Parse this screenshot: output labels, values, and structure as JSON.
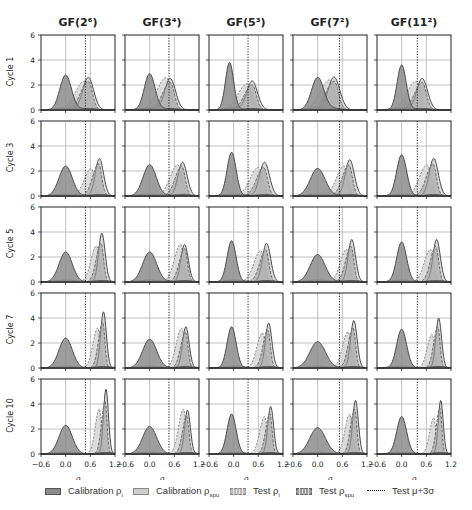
{
  "figure": {
    "columns": [
      "GF(2⁶)",
      "GF(3⁴)",
      "GF(5³)",
      "GF(7²)",
      "GF(11²)"
    ],
    "rows": [
      "Cycle 1",
      "Cycle 3",
      "Cycle 5",
      "Cycle 7",
      "Cycle 10"
    ],
    "xlabel": "ρ",
    "x_ticks": [
      "−0.6",
      "0.0",
      "0.6",
      "1.2"
    ],
    "y_ticks": [
      "0",
      "2",
      "4",
      "6"
    ]
  },
  "legend": {
    "items": [
      {
        "label": "Calibration ρ",
        "sub": "i"
      },
      {
        "label": "Calibration ρ",
        "sub": "spu"
      },
      {
        "label": "Test ρ",
        "sub": "i"
      },
      {
        "label": "Test ρ",
        "sub": "spu"
      },
      {
        "label": "Test μ+3σ",
        "sub": ""
      }
    ]
  },
  "colors": {
    "cal_pi": "#8c8c8c",
    "cal_psu": "#cfcfcf",
    "outline": "#4a4a4a",
    "grid": "#b0b0b0",
    "axis": "#222222"
  },
  "chart_data": {
    "type": "area",
    "title": "",
    "xlabel": "ρ",
    "ylabel": "density",
    "xlim": [
      -0.6,
      1.2
    ],
    "ylim": [
      0,
      6
    ],
    "grid": true,
    "legend_position": "bottom",
    "columns": [
      "GF(2⁶)",
      "GF(3⁴)",
      "GF(5³)",
      "GF(7²)",
      "GF(11²)"
    ],
    "rows": [
      "Cycle 1",
      "Cycle 3",
      "Cycle 5",
      "Cycle 7",
      "Cycle 10"
    ],
    "threshold_mu_plus_3sigma": [
      0.48,
      0.47,
      0.35,
      0.53,
      0.38
    ],
    "panels": [
      [
        {
          "cal_pi": {
            "mu": 0.0,
            "peak": 2.8,
            "sd": 0.14
          },
          "cal_psu": {
            "mu": 0.55,
            "peak": 2.6,
            "sd": 0.13
          },
          "test_pi": {
            "mu": 0.45,
            "peak": 2.3
          },
          "test_psu": {
            "mu": 0.55,
            "peak": 2.5
          }
        },
        {
          "cal_pi": {
            "mu": 0.0,
            "peak": 2.9,
            "sd": 0.13
          },
          "cal_psu": {
            "mu": 0.5,
            "peak": 2.5,
            "sd": 0.13
          },
          "test_pi": {
            "mu": 0.4,
            "peak": 2.6
          },
          "test_psu": {
            "mu": 0.5,
            "peak": 2.4
          }
        },
        {
          "cal_pi": {
            "mu": -0.1,
            "peak": 3.8,
            "sd": 0.1
          },
          "cal_psu": {
            "mu": 0.45,
            "peak": 2.3,
            "sd": 0.13
          },
          "test_pi": {
            "mu": 0.33,
            "peak": 2.1
          },
          "test_psu": {
            "mu": 0.45,
            "peak": 2.2
          }
        },
        {
          "cal_pi": {
            "mu": 0.0,
            "peak": 2.6,
            "sd": 0.15
          },
          "cal_psu": {
            "mu": 0.4,
            "peak": 2.6,
            "sd": 0.14
          },
          "test_pi": {
            "mu": 0.3,
            "peak": 2.4
          },
          "test_psu": {
            "mu": 0.4,
            "peak": 2.5
          }
        },
        {
          "cal_pi": {
            "mu": 0.0,
            "peak": 3.6,
            "sd": 0.11
          },
          "cal_psu": {
            "mu": 0.5,
            "peak": 2.5,
            "sd": 0.13
          },
          "test_pi": {
            "mu": 0.35,
            "peak": 2.3
          },
          "test_psu": {
            "mu": 0.5,
            "peak": 2.4
          }
        }
      ],
      [
        {
          "cal_pi": {
            "mu": 0.0,
            "peak": 2.4,
            "sd": 0.16
          },
          "cal_psu": {
            "mu": 0.82,
            "peak": 3.0,
            "sd": 0.1
          },
          "test_pi": {
            "mu": 0.62,
            "peak": 2.2
          },
          "test_psu": {
            "mu": 0.8,
            "peak": 2.8
          }
        },
        {
          "cal_pi": {
            "mu": 0.0,
            "peak": 2.5,
            "sd": 0.16
          },
          "cal_psu": {
            "mu": 0.8,
            "peak": 2.7,
            "sd": 0.11
          },
          "test_pi": {
            "mu": 0.68,
            "peak": 2.5
          },
          "test_psu": {
            "mu": 0.78,
            "peak": 2.6
          }
        },
        {
          "cal_pi": {
            "mu": -0.05,
            "peak": 3.5,
            "sd": 0.11
          },
          "cal_psu": {
            "mu": 0.75,
            "peak": 2.7,
            "sd": 0.12
          },
          "test_pi": {
            "mu": 0.6,
            "peak": 2.3
          },
          "test_psu": {
            "mu": 0.73,
            "peak": 2.5
          }
        },
        {
          "cal_pi": {
            "mu": 0.0,
            "peak": 2.2,
            "sd": 0.18
          },
          "cal_psu": {
            "mu": 0.78,
            "peak": 2.9,
            "sd": 0.11
          },
          "test_pi": {
            "mu": 0.64,
            "peak": 2.4
          },
          "test_psu": {
            "mu": 0.76,
            "peak": 2.7
          }
        },
        {
          "cal_pi": {
            "mu": 0.0,
            "peak": 3.3,
            "sd": 0.12
          },
          "cal_psu": {
            "mu": 0.78,
            "peak": 3.0,
            "sd": 0.11
          },
          "test_pi": {
            "mu": 0.62,
            "peak": 2.5
          },
          "test_psu": {
            "mu": 0.76,
            "peak": 2.8
          }
        }
      ],
      [
        {
          "cal_pi": {
            "mu": 0.0,
            "peak": 2.4,
            "sd": 0.16
          },
          "cal_psu": {
            "mu": 0.88,
            "peak": 3.9,
            "sd": 0.08
          },
          "test_pi": {
            "mu": 0.75,
            "peak": 2.9
          },
          "test_psu": {
            "mu": 0.86,
            "peak": 3.4
          }
        },
        {
          "cal_pi": {
            "mu": 0.0,
            "peak": 2.4,
            "sd": 0.17
          },
          "cal_psu": {
            "mu": 0.85,
            "peak": 3.0,
            "sd": 0.09
          },
          "test_pi": {
            "mu": 0.75,
            "peak": 3.0
          },
          "test_psu": {
            "mu": 0.85,
            "peak": 2.9
          }
        },
        {
          "cal_pi": {
            "mu": -0.05,
            "peak": 3.3,
            "sd": 0.11
          },
          "cal_psu": {
            "mu": 0.8,
            "peak": 3.1,
            "sd": 0.1
          },
          "test_pi": {
            "mu": 0.66,
            "peak": 2.5
          },
          "test_psu": {
            "mu": 0.78,
            "peak": 2.8
          }
        },
        {
          "cal_pi": {
            "mu": 0.0,
            "peak": 2.2,
            "sd": 0.18
          },
          "cal_psu": {
            "mu": 0.83,
            "peak": 3.4,
            "sd": 0.09
          },
          "test_pi": {
            "mu": 0.7,
            "peak": 2.6
          },
          "test_psu": {
            "mu": 0.81,
            "peak": 3.1
          }
        },
        {
          "cal_pi": {
            "mu": 0.0,
            "peak": 3.2,
            "sd": 0.12
          },
          "cal_psu": {
            "mu": 0.85,
            "peak": 3.4,
            "sd": 0.09
          },
          "test_pi": {
            "mu": 0.7,
            "peak": 2.6
          },
          "test_psu": {
            "mu": 0.83,
            "peak": 3.1
          }
        }
      ],
      [
        {
          "cal_pi": {
            "mu": 0.0,
            "peak": 2.4,
            "sd": 0.16
          },
          "cal_psu": {
            "mu": 0.92,
            "peak": 4.5,
            "sd": 0.07
          },
          "test_pi": {
            "mu": 0.78,
            "peak": 3.2
          },
          "test_psu": {
            "mu": 0.9,
            "peak": 4.0
          }
        },
        {
          "cal_pi": {
            "mu": 0.0,
            "peak": 2.3,
            "sd": 0.17
          },
          "cal_psu": {
            "mu": 0.88,
            "peak": 3.3,
            "sd": 0.08
          },
          "test_pi": {
            "mu": 0.78,
            "peak": 3.2
          },
          "test_psu": {
            "mu": 0.87,
            "peak": 3.1
          }
        },
        {
          "cal_pi": {
            "mu": -0.05,
            "peak": 3.3,
            "sd": 0.11
          },
          "cal_psu": {
            "mu": 0.85,
            "peak": 3.6,
            "sd": 0.08
          },
          "test_pi": {
            "mu": 0.7,
            "peak": 2.8
          },
          "test_psu": {
            "mu": 0.83,
            "peak": 3.3
          }
        },
        {
          "cal_pi": {
            "mu": 0.0,
            "peak": 2.1,
            "sd": 0.19
          },
          "cal_psu": {
            "mu": 0.88,
            "peak": 3.8,
            "sd": 0.08
          },
          "test_pi": {
            "mu": 0.74,
            "peak": 2.9
          },
          "test_psu": {
            "mu": 0.86,
            "peak": 3.5
          }
        },
        {
          "cal_pi": {
            "mu": 0.0,
            "peak": 3.1,
            "sd": 0.12
          },
          "cal_psu": {
            "mu": 0.9,
            "peak": 4.0,
            "sd": 0.07
          },
          "test_pi": {
            "mu": 0.74,
            "peak": 2.7
          },
          "test_psu": {
            "mu": 0.88,
            "peak": 3.6
          }
        }
      ],
      [
        {
          "cal_pi": {
            "mu": 0.0,
            "peak": 2.3,
            "sd": 0.16
          },
          "cal_psu": {
            "mu": 0.98,
            "peak": 5.2,
            "sd": 0.06
          },
          "test_pi": {
            "mu": 0.82,
            "peak": 3.6
          },
          "test_psu": {
            "mu": 0.96,
            "peak": 4.6
          }
        },
        {
          "cal_pi": {
            "mu": 0.0,
            "peak": 2.2,
            "sd": 0.17
          },
          "cal_psu": {
            "mu": 0.92,
            "peak": 3.5,
            "sd": 0.07
          },
          "test_pi": {
            "mu": 0.82,
            "peak": 3.6
          },
          "test_psu": {
            "mu": 0.9,
            "peak": 3.3
          }
        },
        {
          "cal_pi": {
            "mu": -0.05,
            "peak": 3.2,
            "sd": 0.11
          },
          "cal_psu": {
            "mu": 0.9,
            "peak": 3.8,
            "sd": 0.07
          },
          "test_pi": {
            "mu": 0.75,
            "peak": 3.0
          },
          "test_psu": {
            "mu": 0.88,
            "peak": 3.5
          }
        },
        {
          "cal_pi": {
            "mu": 0.0,
            "peak": 2.1,
            "sd": 0.19
          },
          "cal_psu": {
            "mu": 0.92,
            "peak": 4.3,
            "sd": 0.07
          },
          "test_pi": {
            "mu": 0.78,
            "peak": 3.2
          },
          "test_psu": {
            "mu": 0.9,
            "peak": 3.9
          }
        },
        {
          "cal_pi": {
            "mu": 0.0,
            "peak": 3.0,
            "sd": 0.12
          },
          "cal_psu": {
            "mu": 0.95,
            "peak": 4.3,
            "sd": 0.06
          },
          "test_pi": {
            "mu": 0.78,
            "peak": 2.9
          },
          "test_psu": {
            "mu": 0.93,
            "peak": 4.0
          }
        }
      ]
    ]
  }
}
